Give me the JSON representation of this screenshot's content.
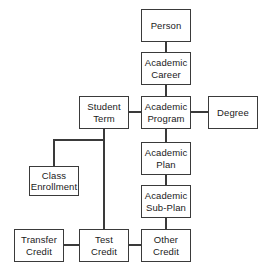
{
  "diagram": {
    "style": {
      "background": "#ffffff",
      "box_fill": "#ffffff",
      "box_stroke": "#3a3a3a",
      "connector_stroke": "#3a3a3a",
      "text_color": "#1a1a1a"
    },
    "nodes": [
      {
        "id": "person",
        "line1": "Person",
        "line2": "",
        "x": 141,
        "y": 9,
        "w": 50,
        "h": 33
      },
      {
        "id": "academic-career",
        "line1": "Academic",
        "line2": "Career",
        "x": 141,
        "y": 52,
        "w": 50,
        "h": 33
      },
      {
        "id": "student-term",
        "line1": "Student",
        "line2": "Term",
        "x": 79,
        "y": 96,
        "w": 50,
        "h": 33
      },
      {
        "id": "academic-program",
        "line1": "Academic",
        "line2": "Program",
        "x": 141,
        "y": 96,
        "w": 50,
        "h": 33
      },
      {
        "id": "degree",
        "line1": "Degree",
        "line2": "",
        "x": 208,
        "y": 96,
        "w": 50,
        "h": 33
      },
      {
        "id": "academic-plan",
        "line1": "Academic",
        "line2": "Plan",
        "x": 141,
        "y": 142,
        "w": 50,
        "h": 33
      },
      {
        "id": "class-enrollment",
        "line1": "Class",
        "line2": "Enrollment",
        "x": 29,
        "y": 166,
        "w": 50,
        "h": 30
      },
      {
        "id": "academic-sub-plan",
        "line1": "Academic",
        "line2": "Sub-Plan",
        "x": 141,
        "y": 185,
        "w": 50,
        "h": 33
      },
      {
        "id": "transfer-credit",
        "line1": "Transfer",
        "line2": "Credit",
        "x": 14,
        "y": 229,
        "w": 50,
        "h": 33
      },
      {
        "id": "test-credit",
        "line1": "Test",
        "line2": "Credit",
        "x": 79,
        "y": 229,
        "w": 50,
        "h": 33
      },
      {
        "id": "other-credit",
        "line1": "Other",
        "line2": "Credit",
        "x": 141,
        "y": 229,
        "w": 50,
        "h": 33
      }
    ],
    "edges": [
      {
        "id": "person-to-academic-career",
        "from": "person",
        "to": "academic-career",
        "points": "166,42 166,52"
      },
      {
        "id": "academic-career-to-academic-program",
        "from": "academic-career",
        "to": "academic-program",
        "points": "166,85 166,96"
      },
      {
        "id": "student-term-to-academic-program",
        "from": "student-term",
        "to": "academic-program",
        "points": "129,112 141,112"
      },
      {
        "id": "academic-program-to-degree",
        "from": "academic-program",
        "to": "degree",
        "points": "191,112 208,112"
      },
      {
        "id": "academic-program-to-academic-plan",
        "from": "academic-program",
        "to": "academic-plan",
        "points": "166,129 166,142"
      },
      {
        "id": "academic-plan-to-academic-sub-plan",
        "from": "academic-plan",
        "to": "academic-sub-plan",
        "points": "166,175 166,185"
      },
      {
        "id": "academic-sub-plan-to-other-credit",
        "from": "academic-sub-plan",
        "to": "other-credit",
        "points": "166,218 166,229"
      },
      {
        "id": "student-term-to-class-enrollment",
        "from": "student-term",
        "to": "class-enrollment",
        "points": "104,129 104,140 54,140 54,166"
      },
      {
        "id": "student-term-to-test-credit",
        "from": "student-term",
        "to": "test-credit",
        "points": "104,129 104,229"
      },
      {
        "id": "transfer-credit-to-test-credit",
        "from": "transfer-credit",
        "to": "test-credit",
        "points": "64,245 79,245"
      },
      {
        "id": "test-credit-to-other-credit",
        "from": "test-credit",
        "to": "other-credit",
        "points": "129,245 141,245"
      }
    ]
  }
}
